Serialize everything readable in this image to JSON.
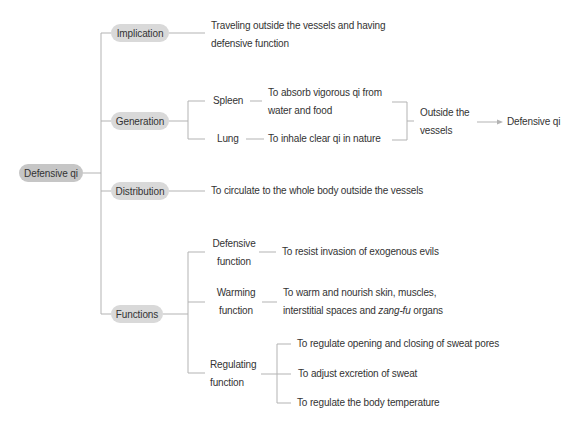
{
  "mindmap": {
    "root": "Defensive qi",
    "implication": {
      "label": "Implication",
      "desc": [
        "Traveling outside the vessels and having",
        "defensive function"
      ]
    },
    "generation": {
      "label": "Generation",
      "sources": [
        {
          "organ": "Spleen",
          "desc": [
            "To absorb vigorous qi from",
            "water and food"
          ]
        },
        {
          "organ": "Lung",
          "desc": [
            "To inhale clear qi in nature"
          ]
        }
      ],
      "merge": [
        "Outside the",
        "vessels"
      ],
      "result": "Defensive qi"
    },
    "distribution": {
      "label": "Distribution",
      "desc": "To circulate to the whole body outside the vessels"
    },
    "functions": {
      "label": "Functions",
      "items": [
        {
          "name": [
            "Defensive",
            "function"
          ],
          "desc": [
            "To resist invasion of exogenous evils"
          ]
        },
        {
          "name": [
            "Warming",
            "function"
          ],
          "desc": [
            "To warm and nourish skin, muscles,",
            "interstitial spaces and ",
            "zang-fu",
            " organs"
          ]
        },
        {
          "name": [
            "Regulating",
            "function"
          ],
          "desc": [
            "To regulate opening and closing of sweat pores",
            "To adjust excretion of sweat",
            "To regulate the body temperature"
          ]
        }
      ]
    }
  },
  "colors": {
    "root_pill": "#c6c6c6",
    "branch_pill": "#d9d9d9",
    "line": "#b3b3b3",
    "text": "#333333"
  }
}
